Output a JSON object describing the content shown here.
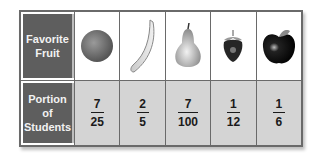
{
  "table": {
    "row_headers": {
      "fruit": "Favorite Fruit",
      "portion": "Portion of Students"
    },
    "columns": [
      {
        "fruit": "orange",
        "icon": "orange-icon",
        "numerator": "7",
        "denominator": "25"
      },
      {
        "fruit": "banana",
        "icon": "banana-icon",
        "numerator": "2",
        "denominator": "5"
      },
      {
        "fruit": "pear",
        "icon": "pear-icon",
        "numerator": "7",
        "denominator": "100"
      },
      {
        "fruit": "strawberry",
        "icon": "strawberry-icon",
        "numerator": "1",
        "denominator": "12"
      },
      {
        "fruit": "apple",
        "icon": "apple-icon",
        "numerator": "1",
        "denominator": "6"
      }
    ]
  },
  "colors": {
    "header_bg": "#5e5e5e",
    "header_text": "#f2f2f2",
    "data_row_bg": "#d4d4d4",
    "border": "#6a6a6a"
  }
}
